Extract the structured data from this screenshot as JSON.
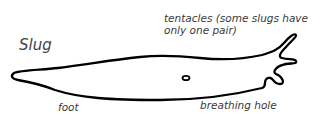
{
  "diagram": {
    "title": "Slug",
    "labels": {
      "tentacles": [
        "tentacles (some slugs have",
        "only one pair)"
      ],
      "foot": "foot",
      "breathing_hole": "breathing hole"
    },
    "colors": {
      "outline": "#000000",
      "text": "#3a3a3a",
      "background": "#ffffff"
    }
  }
}
